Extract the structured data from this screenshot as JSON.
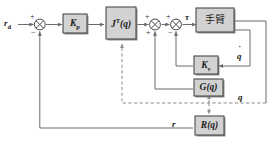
{
  "diagram": {
    "type": "control-block-diagram",
    "colors": {
      "block_fill": "#d2d2d2",
      "block_stroke": "#4a4a4a",
      "block_shadow": "#8f8f8f",
      "wire": "#6b6b6b",
      "dashed_wire": "#8a8a8a",
      "background": "#ffffff",
      "text": "#1b1b1b"
    },
    "blocks": [
      {
        "id": "kp",
        "label_main": "K",
        "label_sub": "p",
        "label_full": "Kp",
        "name": "proportional-gain"
      },
      {
        "id": "jt",
        "label_main": "J",
        "label_sup": "T",
        "label_arg": "(q)",
        "label_full": "J T(q)",
        "name": "jacobian-transpose"
      },
      {
        "id": "arm",
        "label_main": "手臂",
        "label_full": "手臂",
        "name": "robot-arm-plant"
      },
      {
        "id": "kv",
        "label_main": "K",
        "label_sub": "v",
        "label_full": "Kv",
        "name": "velocity-gain"
      },
      {
        "id": "gq",
        "label_main": "G",
        "label_arg": "(q)",
        "label_full": "G(q)",
        "name": "gravity-compensation"
      },
      {
        "id": "rq",
        "label_main": "R",
        "label_arg": "(q)",
        "label_full": "R(q)",
        "name": "forward-kinematics"
      }
    ],
    "signals": {
      "reference": {
        "main": "r",
        "sub": "d",
        "full": "rd"
      },
      "torque": "τ",
      "joint_velocity": {
        "main": "q",
        "accent": "dot",
        "full": "q̇"
      },
      "joint_position": "q",
      "measured_position": "r"
    },
    "summing_junctions": [
      {
        "id": "sum1",
        "name": "error-summing-junction",
        "signs": {
          "in_left": "+",
          "in_bottom": "−"
        }
      },
      {
        "id": "sum2",
        "name": "gravity-summing-junction",
        "signs": {
          "in_left": "+",
          "in_bottom": "+"
        }
      },
      {
        "id": "sum3",
        "name": "damping-summing-junction",
        "signs": {
          "in_left": "+",
          "in_bottom": "−"
        }
      }
    ]
  }
}
